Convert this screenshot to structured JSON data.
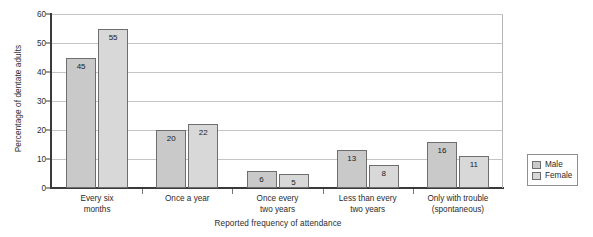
{
  "chart_data": {
    "type": "bar",
    "title": "",
    "xlabel": "Reported frequency of attendance",
    "ylabel": "Percentage of dentate adults",
    "categories": [
      "Every six\nmonths",
      "Once a year",
      "Once every\ntwo years",
      "Less than every\ntwo years",
      "Only with trouble\n(spontaneous)"
    ],
    "series": [
      {
        "name": "Male",
        "values": [
          45,
          20,
          6,
          13,
          16
        ],
        "color": "#c9c9c9"
      },
      {
        "name": "Female",
        "values": [
          55,
          22,
          5,
          8,
          11
        ],
        "color": "#d8d8d8"
      }
    ],
    "ylim": [
      0,
      60
    ],
    "yticks": [
      0,
      10,
      20,
      30,
      40,
      50,
      60
    ],
    "ytick_labels": [
      "0",
      "10",
      "20",
      "30",
      "40",
      "50",
      "60"
    ],
    "grid": "horizontal",
    "legend_position": "right",
    "bar_value_labels": true,
    "bar_border_color": "#6e6e6e"
  },
  "legend": {
    "entries": [
      {
        "label": "Male"
      },
      {
        "label": "Female"
      }
    ]
  },
  "axes": {
    "x_title": "Reported frequency of attendance",
    "y_title": "Percentage of dentate adults"
  },
  "category_labels": [
    {
      "line1": "Every six",
      "line2": "months"
    },
    {
      "line1": "Once a year",
      "line2": ""
    },
    {
      "line1": "Once every",
      "line2": "two years"
    },
    {
      "line1": "Less than every",
      "line2": "two years"
    },
    {
      "line1": "Only with trouble",
      "line2": "(spontaneous)"
    }
  ]
}
